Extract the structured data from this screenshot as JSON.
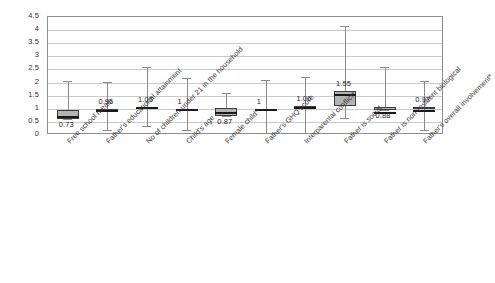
{
  "chart_data": {
    "type": "box",
    "title": "",
    "xlabel": "",
    "ylabel": "",
    "ylim": [
      0,
      4.5
    ],
    "ytick_step": 0.5,
    "grid": true,
    "legend": "none",
    "yticks": [
      "4.5",
      "4",
      "3.5",
      "3",
      "2.5",
      "2",
      "1.5",
      "1",
      "0.5",
      "0"
    ],
    "categories": [
      "Free school meals",
      "Father's educational attainment",
      "No of children under 21 in the household",
      "Child's age",
      "Female child*",
      "Father's GHQ score",
      "Interparental conflict*",
      "Father is social",
      "Father is non-resident biological",
      "Father's overall involvement*"
    ],
    "values": [
      0.73,
      0.96,
      1.05,
      1.0,
      0.87,
      1.0,
      1.06,
      1.55,
      0.88,
      0.97
    ],
    "value_labels": [
      "0.73",
      "0.96",
      "1.05",
      "1",
      "0.87",
      "1",
      "1.06",
      "1.55",
      "0.88",
      "0.97"
    ],
    "boxes": [
      {
        "category": "Free school meals",
        "value": 0.73,
        "label": "0.73",
        "q1": 0.6,
        "q3": 0.94,
        "whisker_low": 0.6,
        "whisker_high": 2.05,
        "label_position": "below"
      },
      {
        "category": "Father's educational attainment",
        "value": 0.96,
        "label": "0.96",
        "q1": 0.94,
        "q3": 1.0,
        "whisker_low": 0.2,
        "whisker_high": 2.02,
        "label_position": "above"
      },
      {
        "category": "No of children under 21 in the household",
        "value": 1.05,
        "label": "1.05",
        "q1": 1.0,
        "q3": 1.08,
        "whisker_low": 0.33,
        "whisker_high": 2.6,
        "label_position": "above"
      },
      {
        "category": "Child's age",
        "value": 1.0,
        "label": "1",
        "q1": 0.99,
        "q3": 1.01,
        "whisker_low": 0.2,
        "whisker_high": 2.18,
        "label_position": "above"
      },
      {
        "category": "Female child*",
        "value": 0.87,
        "label": "0.87",
        "q1": 0.72,
        "q3": 1.03,
        "whisker_low": 0.72,
        "whisker_high": 1.62,
        "label_position": "below"
      },
      {
        "category": "Father's GHQ score",
        "value": 1.0,
        "label": "1",
        "q1": 0.99,
        "q3": 1.01,
        "whisker_low": 0.08,
        "whisker_high": 2.08,
        "label_position": "above"
      },
      {
        "category": "Interparental conflict*",
        "value": 1.06,
        "label": "1.06",
        "q1": 1.03,
        "q3": 1.09,
        "whisker_low": 0.08,
        "whisker_high": 2.22,
        "label_position": "above"
      },
      {
        "category": "Father is social",
        "value": 1.55,
        "label": "1.55",
        "q1": 1.1,
        "q3": 1.66,
        "whisker_low": 0.65,
        "whisker_high": 4.15,
        "label_position": "above"
      },
      {
        "category": "Father is non-resident biological",
        "value": 0.88,
        "label": "0.88",
        "q1": 0.96,
        "q3": 1.06,
        "whisker_low": 0.96,
        "whisker_high": 2.6,
        "label_position": "below"
      },
      {
        "category": "Father's overall involvement*",
        "value": 0.97,
        "label": "0.97",
        "q1": 1.02,
        "q3": 1.08,
        "whisker_low": 0.2,
        "whisker_high": 2.05,
        "label_position": "above"
      }
    ],
    "colors": {
      "box_fill": "#b3b3b3",
      "box_border": "#3c3c3c",
      "median": "#1a1a1a",
      "whisker": "#8a8a8a",
      "gridline": "#c9c9c9",
      "plot_border": "#8d8d8d",
      "text": "#2e2e2e",
      "background": "#ffffff"
    }
  }
}
